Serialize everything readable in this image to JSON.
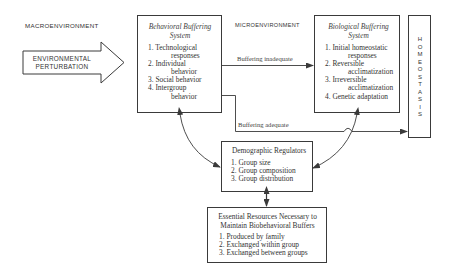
{
  "zones": {
    "macro": "MACROENVIRONMENT",
    "micro": "MICROENVIRONMENT"
  },
  "input_arrow": {
    "line1": "ENVIRONMENTAL",
    "line2": "PERTURBATION"
  },
  "behavioral": {
    "title_line1": "Behavioral Buffering",
    "title_line2": "System",
    "items": [
      {
        "num": "1.",
        "text": "Technological",
        "cont": "responses"
      },
      {
        "num": "2.",
        "text": "Individual",
        "cont": "behavior"
      },
      {
        "num": "3.",
        "text": "Social behavior",
        "cont": ""
      },
      {
        "num": "4.",
        "text": "Intergroup",
        "cont": "behavior"
      }
    ]
  },
  "biological": {
    "title_line1": "Biological Buffering",
    "title_line2": "System",
    "items": [
      {
        "num": "1.",
        "text": "Initial homeostatic",
        "cont": "responses"
      },
      {
        "num": "2.",
        "text": "Reversible",
        "cont": "acclimatization"
      },
      {
        "num": "3.",
        "text": "Irreversible",
        "cont": "acclimatization"
      },
      {
        "num": "4.",
        "text": "Genetic adaptation",
        "cont": ""
      }
    ]
  },
  "homeostasis": {
    "letters": [
      "H",
      "O",
      "M",
      "E",
      "O",
      "S",
      "T",
      "A",
      "S",
      "I",
      "S"
    ]
  },
  "flows": {
    "inadequate": "Buffering inadequate",
    "adequate": "Buffering adequate"
  },
  "demographic": {
    "title": "Demographic Regulators",
    "items": [
      {
        "num": "1.",
        "text": "Group size"
      },
      {
        "num": "2.",
        "text": "Group composition"
      },
      {
        "num": "3.",
        "text": "Group distribution"
      }
    ]
  },
  "resources": {
    "title_line1": "Essential Resources Necessary to",
    "title_line2": "Maintain Biobehavioral Buffers",
    "items": [
      {
        "num": "1.",
        "text": "Produced by family"
      },
      {
        "num": "2.",
        "text": "Exchanged within group"
      },
      {
        "num": "3.",
        "text": "Exchanged between groups"
      }
    ]
  },
  "colors": {
    "stroke": "#3a3a3a",
    "text": "#333333",
    "background": "#ffffff"
  }
}
